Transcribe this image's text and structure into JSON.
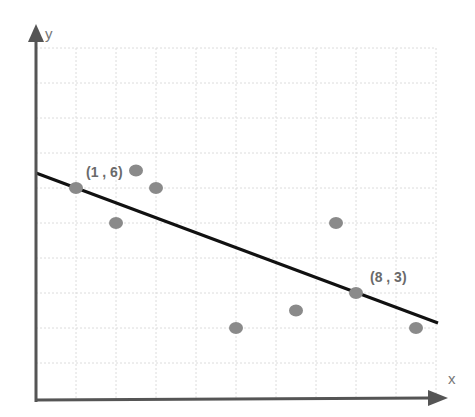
{
  "chart_data": {
    "type": "scatter",
    "title": "",
    "xlabel": "x",
    "ylabel": "y",
    "xlim": [
      0,
      10
    ],
    "ylim": [
      0,
      10
    ],
    "grid": true,
    "legend": null,
    "points": [
      {
        "x": 1,
        "y": 6
      },
      {
        "x": 2,
        "y": 5
      },
      {
        "x": 2.5,
        "y": 6.5
      },
      {
        "x": 3,
        "y": 6
      },
      {
        "x": 5,
        "y": 2
      },
      {
        "x": 6.5,
        "y": 2.5
      },
      {
        "x": 7.5,
        "y": 5
      },
      {
        "x": 8,
        "y": 3
      },
      {
        "x": 9.5,
        "y": 2
      }
    ],
    "trend_line": {
      "through": [
        {
          "x": 1,
          "y": 6
        },
        {
          "x": 8,
          "y": 3
        }
      ],
      "slope": -0.4286,
      "intercept": 6.43,
      "x_range": [
        0,
        10
      ]
    },
    "annotations": [
      {
        "text": "(1 , 6)",
        "x": 1,
        "y": 6
      },
      {
        "text": "(8 , 3)",
        "x": 8,
        "y": 3
      }
    ]
  },
  "labels": {
    "x_axis": "x",
    "y_axis": "y",
    "point_a": "(1 , 6)",
    "point_b": "(8 , 3)"
  },
  "colors": {
    "points": "#8a8a8a",
    "line": "#111111",
    "axes": "#555555",
    "grid": "#dcdcdc"
  }
}
